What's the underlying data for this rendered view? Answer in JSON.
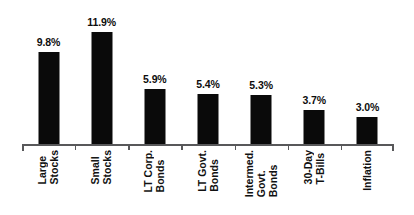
{
  "chart_data": {
    "type": "bar",
    "title": "",
    "subtitle": "",
    "xlabel": "",
    "ylabel": "",
    "ylim": [
      0,
      13
    ],
    "grid": false,
    "legend": null,
    "orientation": "vertical",
    "bar_color": "#0a0a0a",
    "axis_color": "#58585a",
    "label_color": "#111111",
    "categories": [
      "Large Stocks",
      "Small Stocks",
      "LT Corp. Bonds",
      "LT Govt. Bonds",
      "Intermed. Govt. Bonds",
      "30-Day T-Bills",
      "Inflation"
    ],
    "category_lines": [
      [
        "Large",
        "Stocks"
      ],
      [
        "Small",
        "Stocks"
      ],
      [
        "LT Corp.",
        "Bonds"
      ],
      [
        "LT Govt.",
        "Bonds"
      ],
      [
        "Intermed.",
        "Govt.",
        "Bonds"
      ],
      [
        "30-Day",
        "T-Bills"
      ],
      [
        "Inflation"
      ]
    ],
    "values": [
      9.8,
      11.9,
      5.9,
      5.4,
      5.3,
      3.7,
      3.0
    ],
    "value_labels": [
      "9.8%",
      "11.9%",
      "5.9%",
      "5.4%",
      "5.3%",
      "3.7%",
      "3.0%"
    ]
  }
}
